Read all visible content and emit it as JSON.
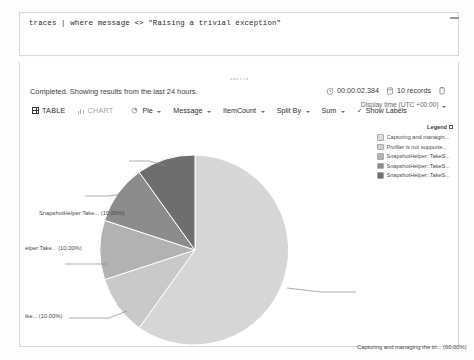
{
  "query": {
    "text": "traces | where message <> \"Raising a trivial exception\""
  },
  "results": {
    "status": "Completed. Showing results from the last 24 hours.",
    "duration": "00:00:02.384",
    "record_count": "10 records",
    "display_time": "Display time (UTC +00:00)",
    "timer_icon": "timer-icon",
    "records_icon": "database-icon",
    "copy_icon": "copy-icon",
    "grip_icon": "drag-grip-icon"
  },
  "toolbar": {
    "table_label": "TABLE",
    "chart_label": "CHART",
    "chart_type": "Pie",
    "x_field": "Message",
    "y_field": "ItemCount",
    "split_by": "Split By",
    "aggregation": "Sum",
    "show_labels": "Show Labels",
    "table_icon": "grid-icon",
    "chart_icon": "bar-chart-icon",
    "pie_icon": "pie-icon",
    "check_icon": "check-icon"
  },
  "legend": {
    "title": "Legend",
    "pin_icon": "pin-icon",
    "items": [
      {
        "label": "Capturing and managin...",
        "color": "#dcdcdc"
      },
      {
        "label": "Profiler is not supporte...",
        "color": "#d0d0d0"
      },
      {
        "label": "SnapshotHelper::TakeS...",
        "color": "#b4b4b4"
      },
      {
        "label": "SnapshotHelper::TakeS...",
        "color": "#8e8e8e"
      },
      {
        "label": "SnapshotHelper::TakeS...",
        "color": "#6f6f6f"
      }
    ]
  },
  "chart_data": {
    "type": "pie",
    "title": "",
    "legend_position": "right",
    "labels": [
      "Capturing and managing the tri...",
      "is not supp...",
      "ike... ",
      "elper:Take...",
      "SnapshotHelper:Take..."
    ],
    "values": [
      60.0,
      10.0,
      10.0,
      10.0,
      10.0
    ],
    "unit": "%",
    "colors": [
      "#d6d6d6",
      "#c9c9c9",
      "#b2b2b2",
      "#8c8c8c",
      "#6e6e6e"
    ],
    "callouts": [
      {
        "text": "SnapshotHelper:Take... (10.00%)",
        "x": 38,
        "y": 151
      },
      {
        "text": "elper:Take... (10.00%)",
        "x": 22,
        "y": 186
      },
      {
        "text": "ike... (10.00%)",
        "x": 48,
        "y": 253
      },
      {
        "text": "is not supp... (10.00%)",
        "x": 24,
        "y": 308
      },
      {
        "text": "Capturing and managing the tri... (60.00%)",
        "x": 353,
        "y": 285
      }
    ]
  }
}
